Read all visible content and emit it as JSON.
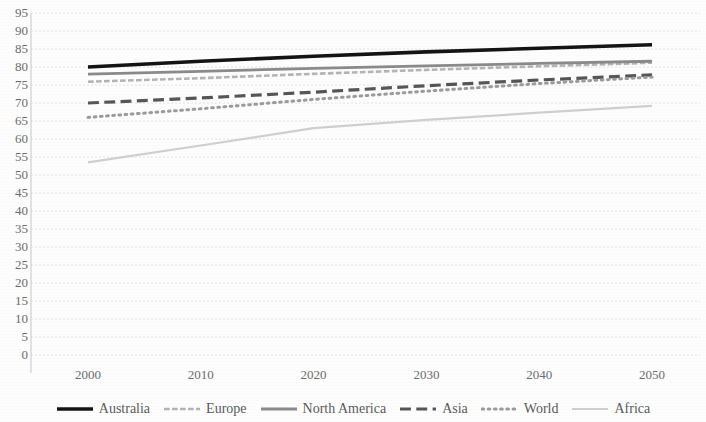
{
  "chart_data": {
    "type": "line",
    "title": "",
    "subtitle": "",
    "xlabel": "",
    "ylabel": "",
    "x": [
      2000,
      2010,
      2020,
      2030,
      2040,
      2050
    ],
    "x_tick_labels": [
      "2000",
      "2010",
      "2020",
      "2030",
      "2040",
      "2050"
    ],
    "xlim": [
      2000,
      2050
    ],
    "ylim": [
      0,
      95
    ],
    "y_tick_labels": [
      "95",
      "90",
      "85",
      "80",
      "75",
      "70",
      "65",
      "60",
      "55",
      "50",
      "45",
      "40",
      "35",
      "30",
      "25",
      "20",
      "15",
      "10",
      "5",
      "0"
    ],
    "y_ticks": [
      95,
      90,
      85,
      80,
      75,
      70,
      65,
      60,
      55,
      50,
      45,
      40,
      35,
      30,
      25,
      20,
      15,
      10,
      5,
      0
    ],
    "grid": true,
    "grid_axis": "y",
    "legend_position": "bottom",
    "series": [
      {
        "name": "Australia",
        "color": "#141414",
        "style": "solid",
        "width": 3.6,
        "values": [
          80.0,
          81.6,
          83.0,
          84.2,
          85.2,
          86.2
        ]
      },
      {
        "name": "Europe",
        "color": "#b4b4b4",
        "style": "dashed",
        "width": 2.6,
        "values": [
          75.9,
          76.9,
          78.1,
          79.2,
          80.2,
          81.2
        ]
      },
      {
        "name": "North America",
        "color": "#8a8a8a",
        "style": "solid",
        "width": 2.8,
        "values": [
          78.0,
          78.8,
          79.6,
          80.3,
          81.0,
          81.6
        ]
      },
      {
        "name": "Asia",
        "color": "#565656",
        "style": "long-dash",
        "width": 3.2,
        "values": [
          70.0,
          71.4,
          73.0,
          74.8,
          76.4,
          77.8
        ]
      },
      {
        "name": "World",
        "color": "#9b9b9b",
        "style": "dotted",
        "width": 3.0,
        "values": [
          66.0,
          68.4,
          71.0,
          73.3,
          75.4,
          77.2
        ]
      },
      {
        "name": "Africa",
        "color": "#cfcfcf",
        "style": "solid",
        "width": 2.2,
        "values": [
          53.5,
          58.2,
          63.0,
          65.3,
          67.3,
          69.2
        ]
      }
    ]
  },
  "axis": {
    "vertical_axis_color": "#d0d0d0",
    "gridline_color": "#e2e2e2"
  },
  "legend": {
    "entries": [
      {
        "label": "Australia"
      },
      {
        "label": "Europe"
      },
      {
        "label": "North America"
      },
      {
        "label": "Asia"
      },
      {
        "label": "World"
      },
      {
        "label": "Africa"
      }
    ]
  }
}
